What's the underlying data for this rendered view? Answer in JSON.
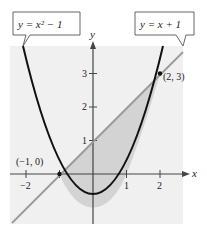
{
  "figure": {
    "curve_label": "y = x² − 1",
    "line_label": "y = x + 1",
    "x_axis_label": "x",
    "y_axis_label": "y",
    "x_ticks": [
      "−2",
      "1",
      "2"
    ],
    "y_ticks": [
      "1",
      "2",
      "3"
    ],
    "points": [
      {
        "label": "(−1, 0)",
        "x": -1,
        "y": 0
      },
      {
        "label": "(2, 3)",
        "x": 2,
        "y": 3
      }
    ],
    "colors": {
      "background_panel": "#f0f0f0",
      "shaded_region": "#d6d6d6",
      "parabola": "#111111",
      "line": "#9a9a9a",
      "axis": "#444444"
    }
  }
}
